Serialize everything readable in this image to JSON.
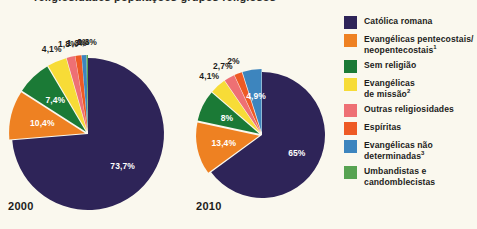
{
  "background_color": "#FAF8EE",
  "cutoff_header": "religiosidades  populações  grupos  religiosos",
  "legend": {
    "items": [
      {
        "label": "Católica romana",
        "color": "#2E2458",
        "note": ""
      },
      {
        "label": "Evangélicas pentecostais/\nneopentecostais",
        "color": "#EE8122",
        "note": "1"
      },
      {
        "label": "Sem religião",
        "color": "#1B7A36",
        "note": ""
      },
      {
        "label": "Evangélicas\nde missão",
        "color": "#F7DC37",
        "note": "2"
      },
      {
        "label": "Outras religiosidades",
        "color": "#EE7074",
        "note": ""
      },
      {
        "label": "Espíritas",
        "color": "#EE5A24",
        "note": ""
      },
      {
        "label": "Evangélicas não\ndeterminadas",
        "color": "#3D85BE",
        "note": "3"
      },
      {
        "label": "Umbandistas e\ncandomblecistas",
        "color": "#57A351",
        "note": ""
      }
    ]
  },
  "charts": [
    {
      "year": "2000",
      "center_x": 88,
      "center_y": 134,
      "radius": 76,
      "start_angle": -90,
      "labels_outside": [
        "0,3%",
        "1%",
        "1,3%",
        "1,8%",
        "4,1%"
      ],
      "labels_inside": [
        "7,4%",
        "10,4%",
        "73,7%"
      ]
    },
    {
      "year": "2010",
      "center_x": 262,
      "center_y": 135,
      "radius": 63,
      "start_angle": -90,
      "labels_outside": [
        "2%",
        "2,7%",
        "4,1%"
      ],
      "labels_inside": [
        "4,9%",
        "8%",
        "13,4%",
        "65%"
      ]
    }
  ],
  "chart_data": {
    "type": "pie",
    "categories": [
      "Católica romana",
      "Evangélicas pentecostais/neopentecostais",
      "Sem religião",
      "Evangélicas de missão",
      "Outras religiosidades",
      "Espíritas",
      "Evangélicas não determinadas",
      "Umbandistas e candomblecistas"
    ],
    "colors": [
      "#2E2458",
      "#EE8122",
      "#1B7A36",
      "#F7DC37",
      "#EE7074",
      "#EE5A24",
      "#3D85BE",
      "#57A351"
    ],
    "legend_position": "right",
    "series": [
      {
        "name": "2000",
        "values": [
          73.7,
          10.4,
          7.4,
          4.1,
          1.8,
          1.3,
          1.0,
          0.3
        ],
        "value_labels": [
          "73,7%",
          "10,4%",
          "7,4%",
          "4,1%",
          "1,8%",
          "1,3%",
          "1%",
          "0,3%"
        ]
      },
      {
        "name": "2010",
        "values": [
          65.0,
          13.4,
          8.0,
          4.1,
          2.7,
          2.0,
          4.9,
          0.0
        ],
        "value_labels": [
          "65%",
          "13,4%",
          "8%",
          "4,1%",
          "2,7%",
          "2%",
          "4,9%",
          ""
        ]
      }
    ]
  }
}
